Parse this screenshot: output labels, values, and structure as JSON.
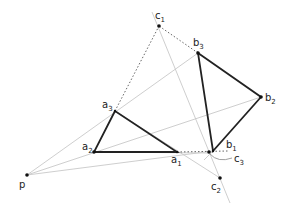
{
  "diagram": {
    "colors": {
      "thin": "#c8c8c8",
      "thick": "#222222",
      "dotted": "#555555",
      "point": "#111111"
    },
    "points": {
      "p": {
        "x": 27,
        "y": 175,
        "base": "p",
        "sub": ""
      },
      "a1": {
        "x": 177,
        "y": 152,
        "base": "a",
        "sub": "1"
      },
      "a2": {
        "x": 94,
        "y": 152,
        "base": "a",
        "sub": "2"
      },
      "a3": {
        "x": 115,
        "y": 111,
        "base": "a",
        "sub": "3"
      },
      "b1": {
        "x": 213,
        "y": 151,
        "base": "b",
        "sub": "1"
      },
      "b2": {
        "x": 261,
        "y": 97,
        "base": "b",
        "sub": "2"
      },
      "b3": {
        "x": 198,
        "y": 53,
        "base": "b",
        "sub": "3"
      },
      "c1": {
        "x": 159,
        "y": 26,
        "base": "c",
        "sub": "1"
      },
      "c2": {
        "x": 220,
        "y": 178,
        "base": "c",
        "sub": "2"
      },
      "c3": {
        "x": 209,
        "y": 153,
        "base": "c",
        "sub": "3"
      }
    },
    "labels": {
      "p": {
        "text": "p",
        "sub": "",
        "x": 19,
        "y": 188
      },
      "a1": {
        "text": "a",
        "sub": "1",
        "x": 171,
        "y": 163
      },
      "a2": {
        "text": "a",
        "sub": "2",
        "x": 82,
        "y": 150
      },
      "a3": {
        "text": "a",
        "sub": "3",
        "x": 102,
        "y": 108
      },
      "b1": {
        "text": "b",
        "sub": "1",
        "x": 226,
        "y": 148
      },
      "b2": {
        "text": "b",
        "sub": "2",
        "x": 265,
        "y": 101
      },
      "b3": {
        "text": "b",
        "sub": "3",
        "x": 193,
        "y": 46
      },
      "c1": {
        "text": "c",
        "sub": "1",
        "x": 156,
        "y": 19
      },
      "c2": {
        "text": "c",
        "sub": "2",
        "x": 211,
        "y": 190
      },
      "c3": {
        "text": "c",
        "sub": "3",
        "x": 234,
        "y": 162
      }
    }
  }
}
